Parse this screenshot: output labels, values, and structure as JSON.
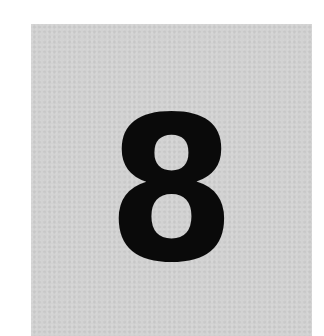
{
  "image": {
    "background_color": "#ffffff",
    "card": {
      "color": "#d2d2d2"
    },
    "digit": {
      "text": "8",
      "color": "#0a0a0a"
    }
  }
}
